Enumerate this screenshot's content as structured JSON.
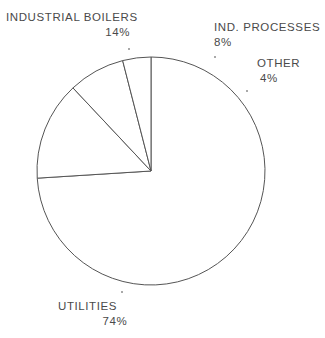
{
  "chart_data": {
    "type": "pie",
    "title": "",
    "subtitle": "",
    "xlabel": "",
    "ylabel": "",
    "grid": false,
    "legend_position": "callout-labels",
    "units": "percent",
    "stroke_color": "#555555",
    "fill_color": "#ffffff",
    "center": {
      "x": 151,
      "y": 171
    },
    "radius": 114,
    "start_angle_deg": 270,
    "direction": "clockwise",
    "categories": [
      "UTILITIES",
      "INDUSTRIAL BOILERS",
      "IND. PROCESSES",
      "OTHER"
    ],
    "values": [
      74,
      14,
      8,
      4
    ],
    "labels": [
      "74%",
      "14%",
      "8%",
      "4%"
    ],
    "slices": [
      {
        "name": "UTILITIES",
        "value": 74,
        "label": "74%",
        "sweep_deg": 266.4,
        "path": "M 151 171 L 83.5 78.8 A 114 114 0 1 0 233.2 100.9 Z"
      },
      {
        "name": "INDUSTRIAL BOILERS",
        "value": 14,
        "label": "14%",
        "sweep_deg": 50.4,
        "path": "M 151 171 L 83.5 78.8 A 114 114 0 0 1 178.7 57.9 Z"
      },
      {
        "name": "IND. PROCESSES",
        "value": 8,
        "label": "8%",
        "sweep_deg": 28.8,
        "path": "M 151 171 L 178.7 57.9 A 114 114 0 0 1 216.1 76.8 Z"
      },
      {
        "name": "OTHER",
        "value": 4,
        "label": "4%",
        "sweep_deg": 14.4,
        "path": "M 151 171 L 216.1 76.8 A 114 114 0 0 1 233.2 100.9 Z"
      }
    ],
    "callouts": [
      {
        "name": "INDUSTRIAL BOILERS",
        "label": "INDUSTRIAL BOILERS",
        "value_label": "14%",
        "dot": {
          "x": 128,
          "y": 48
        }
      },
      {
        "name": "IND. PROCESSES",
        "label": "IND. PROCESSES",
        "value_label": "8%",
        "dot": {
          "x": 214,
          "y": 56
        }
      },
      {
        "name": "OTHER",
        "label": "OTHER",
        "value_label": "4%",
        "dot": {
          "x": 246,
          "y": 90
        }
      },
      {
        "name": "UTILITIES",
        "label": "UTILITIES",
        "value_label": "74%",
        "dot": {
          "x": 121,
          "y": 291
        }
      }
    ]
  },
  "labels": {
    "industrial_boilers": {
      "name": "INDUSTRIAL BOILERS",
      "value": "14%"
    },
    "ind_processes": {
      "name": "IND. PROCESSES",
      "value": "8%"
    },
    "other": {
      "name": "OTHER",
      "value": "4%"
    },
    "utilities": {
      "name": "UTILITIES",
      "value": "74%"
    }
  }
}
